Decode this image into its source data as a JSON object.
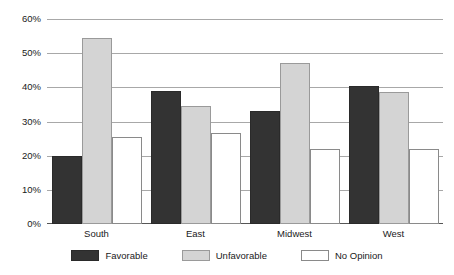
{
  "chart_data": {
    "type": "bar",
    "title": "",
    "subtitle": "",
    "xlabel": "",
    "ylabel": "",
    "categories": [
      "South",
      "East",
      "Midwest",
      "West"
    ],
    "series": [
      {
        "name": "Favorable",
        "color": "#333333",
        "values": [
          20.0,
          39.0,
          33.0,
          40.5
        ]
      },
      {
        "name": "Unfavorable",
        "color": "#d4d4d4",
        "values": [
          54.5,
          34.5,
          47.0,
          38.5
        ]
      },
      {
        "name": "No Opinion",
        "color": "#ffffff",
        "values": [
          25.5,
          26.5,
          22.0,
          22.0
        ]
      }
    ],
    "ylim": [
      0,
      60
    ],
    "yticks": [
      0,
      10,
      20,
      30,
      40,
      50,
      60
    ],
    "ytick_labels": [
      "0%",
      "10%",
      "20%",
      "30%",
      "40%",
      "50%",
      "60%"
    ],
    "grid": true,
    "legend_position": "bottom",
    "legend_entries": [
      "Favorable",
      "Unfavorable",
      "No Opinion"
    ]
  },
  "legend": {
    "items": [
      {
        "label": "Favorable",
        "swatch": "favorable-swatch"
      },
      {
        "label": "Unfavorable",
        "swatch": "unfavorable-swatch"
      },
      {
        "label": "No Opinion",
        "swatch": "no-opinion-swatch"
      }
    ]
  },
  "colors": {
    "favorable": "#333333",
    "unfavorable": "#d4d4d4",
    "no_opinion": "#ffffff",
    "gridline": "#a8a8a8",
    "axis": "#555555",
    "text": "#1a1a1a",
    "background": "#ffffff"
  }
}
